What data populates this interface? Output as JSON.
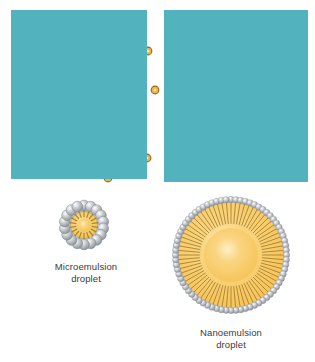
{
  "figure": {
    "background_color": "#ffffff",
    "panels": [
      {
        "name": "microemulsion-panel",
        "x": 11,
        "y": 10,
        "width": 136,
        "height": 169,
        "background_color": "#52b3bf",
        "droplet_color": "#f3b53f",
        "droplet_rim_color": "#8a5a1e",
        "droplets": [
          {
            "cx": 24,
            "cy": 22,
            "r": 4.6
          },
          {
            "cx": 55,
            "cy": 45,
            "r": 4.4
          },
          {
            "cx": 105,
            "cy": 32,
            "r": 4.6
          },
          {
            "cx": 137,
            "cy": 41,
            "r": 4.4
          },
          {
            "cx": 111,
            "cy": 68,
            "r": 4.4
          },
          {
            "cx": 144,
            "cy": 80,
            "r": 4.4
          },
          {
            "cx": 32,
            "cy": 98,
            "r": 4.4
          },
          {
            "cx": 71,
            "cy": 102,
            "r": 4.6
          },
          {
            "cx": 113,
            "cy": 117,
            "r": 4.6
          },
          {
            "cx": 65,
            "cy": 146,
            "r": 4.4
          },
          {
            "cx": 136,
            "cy": 148,
            "r": 4.4
          },
          {
            "cx": 33,
            "cy": 160,
            "r": 4.4
          },
          {
            "cx": 97,
            "cy": 168,
            "r": 4.4
          }
        ]
      },
      {
        "name": "nanoemulsion-panel",
        "x": 164,
        "y": 10,
        "width": 144,
        "height": 172,
        "background_color": "#52b3bf",
        "droplet_color": "#f3b53f",
        "droplet_rim_color": "#8a5a1e",
        "large_droplets": [
          {
            "cx": 46,
            "cy": 35,
            "r": 18.5
          },
          {
            "cx": 108,
            "cy": 71,
            "r": 21.5
          },
          {
            "cx": 48,
            "cy": 125,
            "r": 17.5
          }
        ],
        "small_droplets": [
          {
            "cx": 15,
            "cy": 20,
            "r": 4.4
          },
          {
            "cx": 126,
            "cy": 32,
            "r": 4.4
          },
          {
            "cx": 22,
            "cy": 85,
            "r": 4.6
          },
          {
            "cx": 76,
            "cy": 83,
            "r": 4.6
          },
          {
            "cx": 127,
            "cy": 137,
            "r": 4.4
          },
          {
            "cx": 90,
            "cy": 162,
            "r": 4.4
          }
        ]
      }
    ],
    "diagrams": [
      {
        "name": "microemulsion-droplet-diagram",
        "x": 57,
        "y": 198,
        "size": 54,
        "core_radius": 13,
        "head_count": 18,
        "head_radius": 5.4,
        "head_orbit": 19.5,
        "core_color": "#f0c24a",
        "core_rim_color": "#8a6a1e",
        "head_color": "#c9cdd2",
        "label": "Microemulsion\ndroplet",
        "label_x": 36,
        "label_y": 261,
        "label_width": 100
      },
      {
        "name": "nanoemulsion-droplet-diagram",
        "x": 172,
        "y": 196,
        "size": 118,
        "core_radius": 52,
        "head_count": 72,
        "head_radius": 3.2,
        "head_orbit": 55.5,
        "core_color": "#f6c253",
        "core_rim_color": "#b8862a",
        "head_color": "#c9cdd2",
        "label": "Nanoemulsion\ndroplet",
        "label_x": 172,
        "label_y": 327,
        "label_width": 118
      }
    ]
  }
}
